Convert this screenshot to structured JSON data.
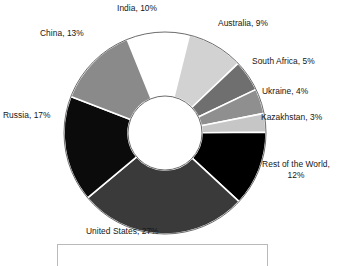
{
  "chart_data": {
    "type": "pie",
    "variant": "donut",
    "title": "",
    "subtitle": "",
    "xlabel": "",
    "ylabel": "",
    "legend_position": "none",
    "grid": false,
    "units": "percent",
    "total": 100,
    "start_angle_deg": -22,
    "direction": "clockwise",
    "categories": [
      "India",
      "Australia",
      "South Africa",
      "Ukraine",
      "Kazakhstan",
      "Rest of the World",
      "United States",
      "Russia",
      "China"
    ],
    "values": [
      10,
      9,
      5,
      4,
      3,
      12,
      27,
      17,
      13
    ],
    "slices": [
      {
        "name": "India",
        "value": 10,
        "label": "India, 10%",
        "color": "#ffffff",
        "label_pos": {
          "x": 117,
          "y": 3
        },
        "wrap": false
      },
      {
        "name": "Australia",
        "value": 9,
        "label": "Australia, 9%",
        "color": "#d2d2d2",
        "label_pos": {
          "x": 218,
          "y": 18
        },
        "wrap": false
      },
      {
        "name": "South Africa",
        "value": 5,
        "label": "South Africa, 5%",
        "color": "#6f6f6f",
        "label_pos": {
          "x": 252,
          "y": 56
        },
        "wrap": false
      },
      {
        "name": "Ukraine",
        "value": 4,
        "label": "Ukraine, 4%",
        "color": "#8f8f8f",
        "label_pos": {
          "x": 262,
          "y": 86
        },
        "wrap": false
      },
      {
        "name": "Kazakhstan",
        "value": 3,
        "label": "Kazakhstan, 3%",
        "color": "#c6c6c6",
        "label_pos": {
          "x": 261,
          "y": 112
        },
        "wrap": false
      },
      {
        "name": "Rest of the World",
        "value": 12,
        "label": "Rest of the World, 12%",
        "color": "#000000",
        "label_pos": {
          "x": 253,
          "y": 159
        },
        "wrap": true
      },
      {
        "name": "United States",
        "value": 27,
        "label": "United States, 27%",
        "color": "#3a3a3a",
        "label_pos": {
          "x": 86,
          "y": 226
        },
        "wrap": false
      },
      {
        "name": "Russia",
        "value": 17,
        "label": "Russia, 17%",
        "color": "#0b0b0b",
        "label_pos": {
          "x": 3,
          "y": 110
        },
        "wrap": false
      },
      {
        "name": "China",
        "value": 13,
        "label": "China, 13%",
        "color": "#8a8a8a",
        "label_pos": {
          "x": 40,
          "y": 28
        },
        "wrap": false
      }
    ],
    "geometry": {
      "center_x": 165,
      "center_y": 133,
      "outer_radius": 101,
      "inner_radius": 37,
      "separator_color": "#ffffff",
      "separator_width": 1.6,
      "outline_color": "#5a5a5a"
    }
  },
  "footer": {
    "caption_box_present": true,
    "caption_text": ""
  }
}
